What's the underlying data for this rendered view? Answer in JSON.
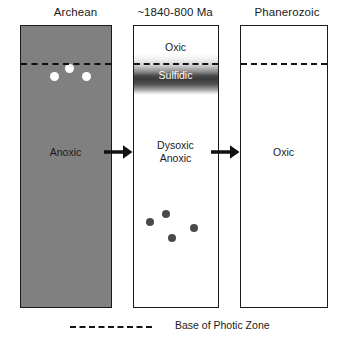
{
  "figure": {
    "type": "three-stage-ocean-redox-diagram",
    "width": 343,
    "height": 346,
    "background": "#ffffff"
  },
  "columns": [
    {
      "key": "archean",
      "title": "Archean",
      "panel_fill": "#808080",
      "panel_fill_name": "gray",
      "photic_zone_line": true,
      "zones": [
        {
          "label": "Anoxic",
          "text_color": "#1a1a1a"
        }
      ],
      "markers": {
        "name": "white-dots",
        "color": "#ffffff",
        "count": 3,
        "points": [
          {
            "cx": 48,
            "cy": 42,
            "r": 4.5
          },
          {
            "cx": 33,
            "cy": 50,
            "r": 4.5
          },
          {
            "cx": 65,
            "cy": 50,
            "r": 4.5
          }
        ]
      }
    },
    {
      "key": "proterozoic",
      "title": "~1840-800 Ma",
      "panel_fill": "#ffffff",
      "panel_fill_name": "white",
      "photic_zone_line": true,
      "zones": [
        {
          "label": "Oxic",
          "text_color": "#1a1a1a"
        },
        {
          "label": "Sulfidic",
          "text_color": "#ffffff"
        },
        {
          "label": "Dysoxic",
          "text_color": "#1a1a1a"
        },
        {
          "label": "Anoxic",
          "text_color": "#1a1a1a"
        }
      ],
      "markers": {
        "name": "dark-dots",
        "color": "#4a4a4a",
        "count": 4,
        "points": [
          {
            "cx": 40,
            "cy": 56,
            "r": 4.2
          },
          {
            "cx": 24,
            "cy": 64,
            "r": 4.2
          },
          {
            "cx": 68,
            "cy": 70,
            "r": 4.2
          },
          {
            "cx": 46,
            "cy": 80,
            "r": 4.2
          }
        ]
      }
    },
    {
      "key": "phanerozoic",
      "title": "Phanerozoic",
      "panel_fill": "#ffffff",
      "panel_fill_name": "white",
      "photic_zone_line": true,
      "zones": [
        {
          "label": "Oxic",
          "text_color": "#1a1a1a"
        }
      ],
      "markers": null
    }
  ],
  "arrows": [
    {
      "name": "arrow-archean-to-proterozoic",
      "direction": "right"
    },
    {
      "name": "arrow-proterozoic-to-phanerozoic",
      "direction": "right"
    }
  ],
  "legend": {
    "dash_label": "Base of Photic Zone",
    "dash_color": "#141414"
  }
}
